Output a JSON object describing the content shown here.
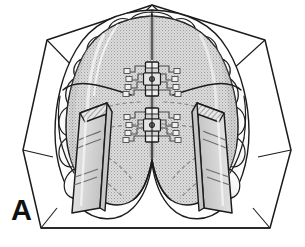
{
  "figure": {
    "panel_label": "A",
    "domain": "medical-dental-line-illustration",
    "view": "occlusal view of maxillary arch",
    "background_color": "#ffffff",
    "line_color": "#1a1a1a",
    "acrylic_fill": "#d9d9d9",
    "acrylic_stipple_color": "#9a9a9a",
    "tooth_fill": "#fbfbfb",
    "tooth_shadow": "#cfcfcf",
    "bite_block_fill": "#dcdcdc",
    "bite_block_hatch_color": "#555555",
    "metal_fill": "#eeeeee",
    "wire_color": "#2b2b2b",
    "hidden_line_color": "#8c8c8c"
  },
  "components": [
    {
      "name": "cast-base",
      "label": "Stone cast base",
      "shape": "hexagonal trimmed plaster model outline",
      "count": 1
    },
    {
      "name": "maxillary-arch-teeth",
      "label": "Maxillary dental arch",
      "shape": "horseshoe row of tooth outlines",
      "count": 14
    },
    {
      "name": "acrylic-palatal-plate",
      "label": "Split acrylic palatal plate",
      "shape": "stippled horseshoe plate with posterior V notch",
      "count": 1
    },
    {
      "name": "midline-split",
      "label": "Midline sagittal split",
      "shape": "vertical separation line",
      "count": 1
    },
    {
      "name": "expansion-screw-anterior",
      "label": "Anterior jackscrew expander",
      "shape": "rectangular screw body with central key hole",
      "count": 1
    },
    {
      "name": "expansion-screw-posterior",
      "label": "Posterior jackscrew expander",
      "shape": "rectangular screw body with central key hole",
      "count": 1
    },
    {
      "name": "retention-wire-arms",
      "label": "Screw guide wires / retention arms",
      "shape": "paired stepped wire arms embedded in acrylic",
      "count": 4
    },
    {
      "name": "bite-block-left",
      "label": "Left posterior acrylic bite block",
      "shape": "rectangular block with hatched occlusal face",
      "count": 1
    },
    {
      "name": "bite-block-right",
      "label": "Right posterior acrylic bite block",
      "shape": "rectangular block with hatched occlusal face",
      "count": 1
    },
    {
      "name": "clasp-wires",
      "label": "Embedded clasp wires (hidden detail)",
      "shape": "dashed curved lines beneath acrylic",
      "count": 6
    }
  ]
}
